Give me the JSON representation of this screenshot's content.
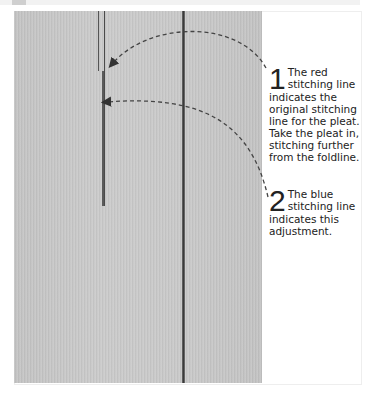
{
  "diagram": {
    "type": "annotated-photo",
    "callouts": [
      {
        "number": "1",
        "lead": "The red",
        "text_line2": "stitching line",
        "body": "indicates the original stitching line for the pleat. Take the pleat in, stitching further from the foldline."
      },
      {
        "number": "2",
        "lead": "The blue",
        "text_line2": "stitching line",
        "body": "indicates this adjustment."
      }
    ]
  }
}
